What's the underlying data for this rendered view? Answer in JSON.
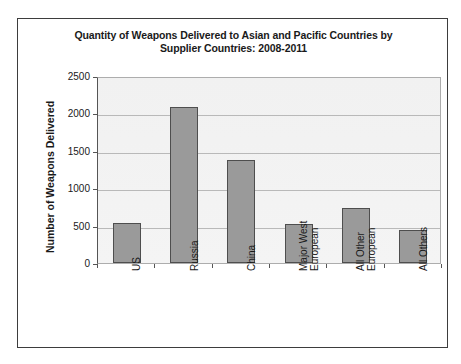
{
  "chart_data": {
    "type": "bar",
    "title": "Quantity of Weapons Delivered to Asian and Pacific Countries by Supplier Countries: 2008-2011",
    "title_lines": [
      "Quantity of Weapons Delivered to Asian and Pacific Countries by",
      "Supplier Countries: 2008-2011"
    ],
    "xlabel": "",
    "ylabel": "Number of Weapons Delivered",
    "categories": [
      "US",
      "Russia",
      "China",
      "Major West European",
      "All Other European",
      "All Others"
    ],
    "category_lines": [
      [
        "US"
      ],
      [
        "Russia"
      ],
      [
        "China"
      ],
      [
        "Major West",
        "European"
      ],
      [
        "All Other",
        "European"
      ],
      [
        "All Others"
      ]
    ],
    "values": [
      535,
      2090,
      1380,
      520,
      730,
      440
    ],
    "ylim": [
      0,
      2500
    ],
    "yticks": [
      0,
      500,
      1000,
      1500,
      2000,
      2500
    ],
    "ytick_labels": [
      "0",
      "500",
      "1000",
      "1500",
      "2000",
      "2500"
    ],
    "grid": true,
    "legend": false,
    "bar_color": "#9a9a9a",
    "bar_edge_color": "#4e4e4e",
    "plot_background": "#f2f2f2",
    "gridline_color": "#b9b9b9",
    "axis_color": "#555555",
    "frame_color": "#3d3d3d",
    "text_color": "#1a1a1a"
  }
}
